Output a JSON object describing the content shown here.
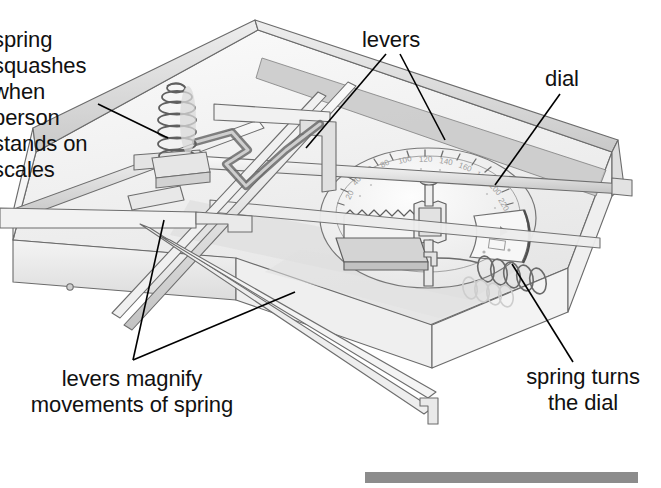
{
  "diagram": {
    "canvas": {
      "width": 661,
      "height": 488,
      "background": "#ffffff"
    },
    "palette": {
      "ink": "#555555",
      "ink_dark": "#333333",
      "text": "#111111",
      "fill_light": "#f2f2f2",
      "fill_mid": "#d8d8d8",
      "fill_shadow": "#bfbfbf",
      "grey_bar": "#8c8c8c",
      "leader_line": "#000000"
    },
    "labels": [
      {
        "id": "spring-squashes",
        "text": "spring\nsquashes\nwhen\nperson\nstands on\nscales",
        "align": "left",
        "clipped_at_left_edge": true,
        "leader": "points right-down to the coil spring"
      },
      {
        "id": "levers",
        "text": "levers",
        "align": "left",
        "leader": "two lines, a V, to the two long lever arms"
      },
      {
        "id": "dial",
        "text": "dial",
        "align": "left",
        "leader": "one line down-left onto the numbered dial face"
      },
      {
        "id": "levers-magnify",
        "text": "levers magnify\nmovements of spring",
        "align": "center",
        "leader": "two lines rising to the long lever bars"
      },
      {
        "id": "spring-turns",
        "text": "spring turns\nthe dial",
        "align": "center",
        "leader": "one line up-left to the horizontal coil spring"
      }
    ],
    "parts": [
      {
        "name": "base-pan",
        "description": "open shallow box seen in 3/4 view"
      },
      {
        "name": "coil-spring-vertical",
        "description": "compression spring, ~6 turns, left of centre"
      },
      {
        "name": "lever-arms",
        "description": "four long flat bars crossing the pan"
      },
      {
        "name": "dial-face",
        "description": "large ellipse with tick marks and numbers"
      },
      {
        "name": "rack-and-pinion",
        "description": "toothed rack and gear at dial centre"
      },
      {
        "name": "coil-spring-horizontal",
        "description": "hairspring that returns the dial"
      },
      {
        "name": "pointer-window",
        "description": "curved window over the dial numbers"
      },
      {
        "name": "screw-dot",
        "description": "small fixing dot on the front wall"
      }
    ],
    "grey_bar": {
      "x": 365,
      "y": 472,
      "width": 273,
      "height": 11,
      "color": "#8c8c8c"
    }
  }
}
